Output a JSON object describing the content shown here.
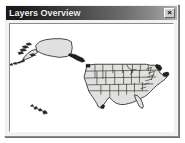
{
  "window": {
    "title": "Layers Overview",
    "close_label": "×",
    "close_icon": "close-icon"
  },
  "map": {
    "background_color": "#ffffff",
    "land_fill": "#e0e0de",
    "outline_color": "#1a1a1a",
    "state_line_color": "#2b2b2b",
    "regions": [
      {
        "name": "Alaska",
        "position": "upper-left"
      },
      {
        "name": "Hawaii",
        "position": "lower-left"
      },
      {
        "name": "Continental United States",
        "position": "right"
      }
    ]
  },
  "colors": {
    "titlebar_dark": "#191919",
    "titlebar_light": "#b4b4b2",
    "title_text": "#f4f4f2",
    "window_face": "#f2f2f0",
    "frame_shadow": "#8b8b88"
  }
}
